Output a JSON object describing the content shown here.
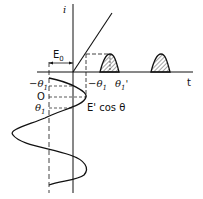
{
  "diagram": {
    "type": "transfer-characteristic",
    "axes": {
      "vertical_label": "i",
      "horizontal_label": "t"
    },
    "labels": {
      "bias": "E",
      "bias_sub": "0",
      "neg_theta": "−θ",
      "neg_theta_sub": "1",
      "zero": "O",
      "pos_theta": "θ",
      "pos_theta_sub": "1",
      "neg_theta_right": "−θ",
      "neg_theta_right_sub": "1",
      "theta_prime": "θ",
      "theta_prime_sub": "1",
      "theta_prime_mark": "'",
      "input_signal": "E' cos θ"
    },
    "elements": [
      "characteristic-line",
      "input-cosine-wave",
      "output-current-pulse-1",
      "output-current-pulse-2",
      "dashed-projection-lines"
    ]
  }
}
